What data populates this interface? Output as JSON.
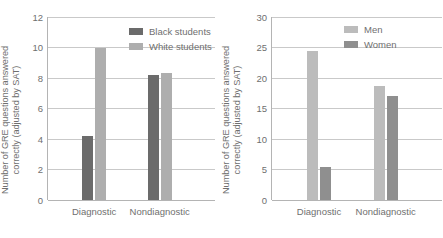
{
  "chart_data": [
    {
      "type": "bar",
      "panel": "left",
      "title": "",
      "xlabel": "",
      "ylabel": "Number of GRE questions answered\ncorrectly (adjusted by SAT)",
      "categories": [
        "Diagnostic",
        "Nondiagnostic"
      ],
      "yticks": [
        0,
        2,
        4,
        6,
        8,
        10,
        12
      ],
      "ylim": [
        0,
        12
      ],
      "grid": true,
      "legend_position": "top-right",
      "series": [
        {
          "name": "Black students",
          "color": "#6b6b6b",
          "values": [
            4.2,
            8.2
          ]
        },
        {
          "name": "White students",
          "color": "#aeaeae",
          "values": [
            10.0,
            8.3
          ]
        }
      ]
    },
    {
      "type": "bar",
      "panel": "right",
      "title": "",
      "xlabel": "",
      "ylabel": "Number of GRE questions answered\ncorrectly (adjusted by SAT)",
      "categories": [
        "Diagnostic",
        "Nondiagnostic"
      ],
      "yticks": [
        0,
        5,
        10,
        15,
        20,
        25,
        30
      ],
      "ylim": [
        0,
        30
      ],
      "grid": true,
      "legend_position": "top-right",
      "series": [
        {
          "name": "Men",
          "color": "#bcbcbc",
          "values": [
            24.5,
            18.7
          ]
        },
        {
          "name": "Women",
          "color": "#8f8f8f",
          "values": [
            5.4,
            17.0
          ]
        }
      ]
    }
  ]
}
